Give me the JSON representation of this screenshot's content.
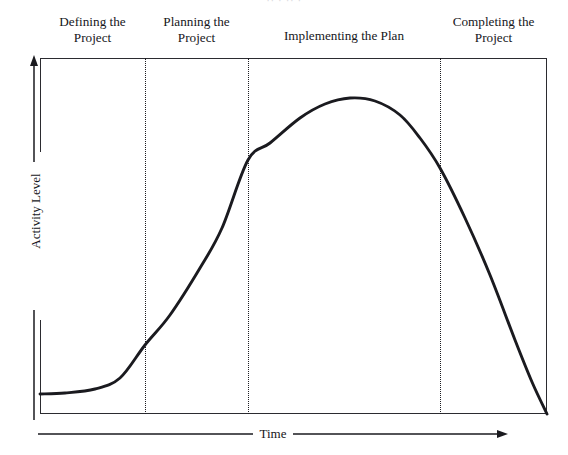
{
  "figure": {
    "top_cut_text": "··   ·           ··           ·",
    "line_color": "#1a1a1f",
    "frame_color": "#2b2b30",
    "background": "#ffffff"
  },
  "axes": {
    "y_label": "Activity Level",
    "x_label": "Time",
    "y_arrow_icon": "arrow-up-icon",
    "x_arrow_icon": "arrow-right-icon"
  },
  "phases": [
    {
      "label_line1": "Defining the",
      "label_line2": "Project",
      "lines": 2,
      "left": 0,
      "width": 105
    },
    {
      "label_line1": "Planning the",
      "label_line2": "Project",
      "lines": 2,
      "left": 105,
      "width": 103
    },
    {
      "label_line1": "Implementing the Plan",
      "label_line2": "",
      "lines": 1,
      "left": 208,
      "width": 192
    },
    {
      "label_line1": "Completing the",
      "label_line2": "Project",
      "lines": 2,
      "left": 400,
      "width": 107
    }
  ],
  "dividers": [
    {
      "name": "divider-defining-planning",
      "x": 145
    },
    {
      "name": "divider-planning-implementing",
      "x": 248
    },
    {
      "name": "divider-implementing-completing",
      "x": 440
    }
  ],
  "chart_data": {
    "type": "line",
    "title": "",
    "xlabel": "Time",
    "ylabel": "Activity Level",
    "grid": false,
    "legend": null,
    "xlim": [
      0,
      100
    ],
    "ylim": [
      0,
      100
    ],
    "axis_tick_labels": {
      "x": [],
      "y": []
    },
    "annotations": [
      "Defining the Project",
      "Planning the Project",
      "Implementing the Plan",
      "Completing the Project"
    ],
    "phase_boundaries_pct": [
      20.7,
      41.0,
      78.9
    ],
    "series": [
      {
        "name": "Activity Level",
        "x": [
          0,
          5,
          10,
          15,
          20.7,
          26,
          32,
          41.0,
          48,
          55,
          61,
          66,
          72,
          78.9,
          85,
          91,
          96,
          100
        ],
        "y": [
          5.6,
          5.8,
          6.5,
          8.5,
          13.8,
          22,
          34,
          57.0,
          70,
          80,
          86,
          88.5,
          86,
          69.0,
          52,
          34,
          17,
          0
        ]
      }
    ],
    "curve_points_px": [
      [
        40,
        394
      ],
      [
        65,
        393
      ],
      [
        95,
        389
      ],
      [
        120,
        378
      ],
      [
        145,
        345
      ],
      [
        170,
        315
      ],
      [
        200,
        268
      ],
      [
        222,
        228
      ],
      [
        248,
        160
      ],
      [
        270,
        143
      ],
      [
        300,
        118
      ],
      [
        325,
        104
      ],
      [
        350,
        98
      ],
      [
        375,
        101
      ],
      [
        400,
        115
      ],
      [
        420,
        138
      ],
      [
        440,
        168
      ],
      [
        465,
        218
      ],
      [
        490,
        275
      ],
      [
        515,
        340
      ],
      [
        532,
        382
      ],
      [
        547,
        414
      ]
    ]
  }
}
